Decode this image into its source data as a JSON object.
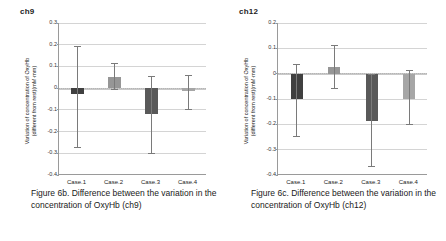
{
  "figure": {
    "panels": [
      {
        "title": "ch9",
        "caption": "Figure 6b. Difference between the variation in the concentration of OxyHb (ch9)",
        "ylabel_line1": "Variation of concentration of OxyHb",
        "ylabel_line2": "(different from rest)(mM·mm)",
        "yticks": [
          "0.3",
          "0.2",
          "0.1",
          "0",
          "-0.1",
          "-0.2",
          "-0.3",
          "-0.4"
        ],
        "xticks": [
          "Case.1",
          "Case.2",
          "Case.3",
          "Case.4"
        ]
      },
      {
        "title": "ch12",
        "caption": "Figure 6c. Difference between the variation in the concentration of OxyHb (ch12)",
        "ylabel_line1": "Variation of concentration of OxyHb",
        "ylabel_line2": "(different from rest)(mM·mm)",
        "yticks": [
          "0.2",
          "0.1",
          "0",
          "-0.1",
          "-0.2",
          "-0.3",
          "-0.4"
        ],
        "xticks": [
          "Case.1",
          "Case.2",
          "Case.3",
          "Case.4"
        ]
      }
    ]
  },
  "colors": {
    "bar_case1": "#404040",
    "bar_case2": "#969696",
    "bar_case3": "#595959",
    "bar_case4": "#a6a6a6",
    "error_bar": "#7a7a7a",
    "gridline": "#d4d4d4",
    "axis": "#9a9a9a",
    "text": "#1a1a1a"
  },
  "chart_data": [
    {
      "type": "bar",
      "title": "ch9",
      "xlabel": "",
      "ylabel": "Variation of concentration of OxyHb (different from rest)(mM·mm)",
      "ylim": [
        -0.4,
        0.3
      ],
      "ytick_values": [
        0.3,
        0.2,
        0.1,
        0,
        -0.1,
        -0.2,
        -0.3,
        -0.4
      ],
      "grid": true,
      "legend": "none",
      "categories": [
        "Case.1",
        "Case.2",
        "Case.3",
        "Case.4"
      ],
      "values": [
        -0.025,
        0.05,
        -0.12,
        -0.015
      ],
      "error_upper": [
        0.195,
        0.115,
        0.055,
        0.06
      ],
      "error_lower": [
        -0.27,
        -0.005,
        -0.3,
        -0.095
      ],
      "bar_colors": [
        "#404040",
        "#969696",
        "#595959",
        "#a6a6a6"
      ]
    },
    {
      "type": "bar",
      "title": "ch12",
      "xlabel": "",
      "ylabel": "Variation of concentration of OxyHb (different from rest)(mM·mm)",
      "ylim": [
        -0.4,
        0.2
      ],
      "ytick_values": [
        0.2,
        0.1,
        0,
        -0.1,
        -0.2,
        -0.3,
        -0.4
      ],
      "grid": true,
      "legend": "none",
      "categories": [
        "Case.1",
        "Case.2",
        "Case.3",
        "Case.4"
      ],
      "values": [
        -0.1,
        0.025,
        -0.185,
        -0.1
      ],
      "error_upper": [
        0.04,
        0.115,
        0.0,
        0.015
      ],
      "error_lower": [
        -0.245,
        -0.055,
        -0.365,
        -0.2
      ],
      "bar_colors": [
        "#404040",
        "#969696",
        "#595959",
        "#a6a6a6"
      ]
    }
  ]
}
